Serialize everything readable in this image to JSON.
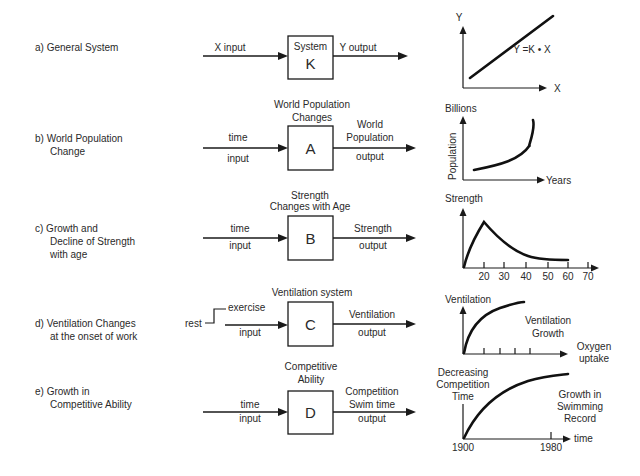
{
  "colors": {
    "ink": "#1a1a1a",
    "text": "#2a2a2a",
    "background": "#ffffff"
  },
  "rows": [
    {
      "id": "a",
      "label_lines": [
        "a)  General System"
      ],
      "input_lines": [
        "X input"
      ],
      "box_title_lines": [],
      "box_inner_title": "System",
      "box_letter": "K",
      "output_lines": [
        "Y output"
      ],
      "graph": {
        "y_label": "Y",
        "x_label": "X",
        "annotation": "Y =K • X"
      }
    },
    {
      "id": "b",
      "label_lines": [
        "b)  World Population",
        "Change"
      ],
      "input_lines": [
        "time",
        "input"
      ],
      "box_title_lines": [
        "World Population",
        "Changes"
      ],
      "box_letter": "A",
      "output_lines": [
        "World",
        "Population",
        "output"
      ],
      "graph": {
        "y_label": "Billions",
        "y_axis_rotated_label": "Population",
        "x_label": "Years"
      }
    },
    {
      "id": "c",
      "label_lines": [
        "c)  Growth and",
        "Decline of Strength",
        "with age"
      ],
      "input_lines": [
        "time",
        "input"
      ],
      "box_title_lines": [
        "Strength",
        "Changes with Age"
      ],
      "box_letter": "B",
      "output_lines": [
        "Strength",
        "output"
      ],
      "graph": {
        "y_label": "Strength",
        "x_ticks": [
          "20",
          "30",
          "40",
          "50",
          "60",
          "70"
        ]
      }
    },
    {
      "id": "d",
      "label_lines": [
        "d)  Ventilation Changes",
        "at the onset of work"
      ],
      "input_step": {
        "from": "rest",
        "to": "exercise"
      },
      "input_lines": [
        "input"
      ],
      "box_title_lines": [
        "Ventilation system"
      ],
      "box_letter": "C",
      "output_lines": [
        "Ventilation",
        "output"
      ],
      "graph": {
        "y_label": "Ventilation",
        "annotation_lines": [
          "Ventilation",
          "Growth"
        ],
        "x_label_lines": [
          "Oxygen",
          "uptake"
        ]
      }
    },
    {
      "id": "e",
      "label_lines": [
        "e)  Growth in",
        "Competitive Ability"
      ],
      "input_lines": [
        "time",
        "input"
      ],
      "box_title_lines": [
        "Competitive",
        "Ability"
      ],
      "box_letter": "D",
      "output_lines": [
        "Competition",
        "Swim time",
        "output"
      ],
      "graph": {
        "y_label_lines": [
          "Decreasing",
          "Competition",
          "Time"
        ],
        "annotation_lines": [
          "Growth in",
          "Swimming",
          "Record"
        ],
        "x_label": "time",
        "x_ticks": [
          "1900",
          "1980"
        ]
      }
    }
  ]
}
